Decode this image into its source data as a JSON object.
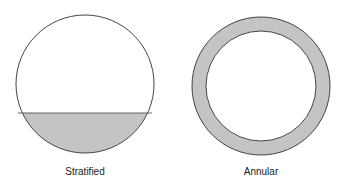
{
  "diagrams": [
    {
      "label": "Stratified",
      "fill_color": "#c4c4c4"
    },
    {
      "label": "Annular",
      "fill_color": "#c4c4c4"
    }
  ]
}
